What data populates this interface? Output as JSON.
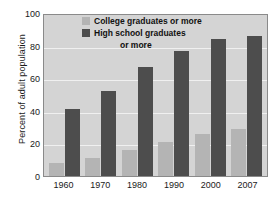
{
  "chart_data": {
    "type": "bar",
    "title": "",
    "xlabel": "",
    "ylabel": "Percent of adult population",
    "categories": [
      "1960",
      "1970",
      "1980",
      "1990",
      "2000",
      "2007"
    ],
    "ylim": [
      0,
      100
    ],
    "yticks": [
      0,
      20,
      40,
      60,
      80,
      100
    ],
    "ytick_labels": [
      "0",
      "20",
      "40",
      "60",
      "80",
      "100"
    ],
    "grid": true,
    "legend_position": "top-center",
    "series": [
      {
        "name": "College graduates or more",
        "color": "#b4b4b4",
        "values": [
          8,
          11,
          16,
          21,
          26,
          29
        ]
      },
      {
        "name": "High school graduates or more",
        "color": "#4d4d4d",
        "values": [
          41,
          52,
          67,
          77,
          84,
          86
        ]
      }
    ]
  },
  "legend": {
    "line1": "College graduates or more",
    "line2": "High school graduates",
    "line3": "or more"
  },
  "colors": {
    "plot_background": "#d4d4d4",
    "gridline": "#f0f0f0",
    "axis_border": "#8a8a8a",
    "college_bar": "#b4b4b4",
    "highschool_bar": "#4d4d4d",
    "text": "#1a1a1a"
  }
}
